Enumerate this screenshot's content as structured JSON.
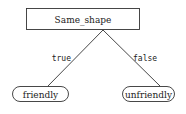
{
  "diagram": {
    "type": "decision-tree",
    "root": {
      "label": "Same_shape"
    },
    "edges": [
      {
        "label": "true",
        "to": "friendly"
      },
      {
        "label": "false",
        "to": "unfriendly"
      }
    ],
    "leaves": [
      {
        "label": "friendly"
      },
      {
        "label": "unfriendly"
      }
    ]
  }
}
